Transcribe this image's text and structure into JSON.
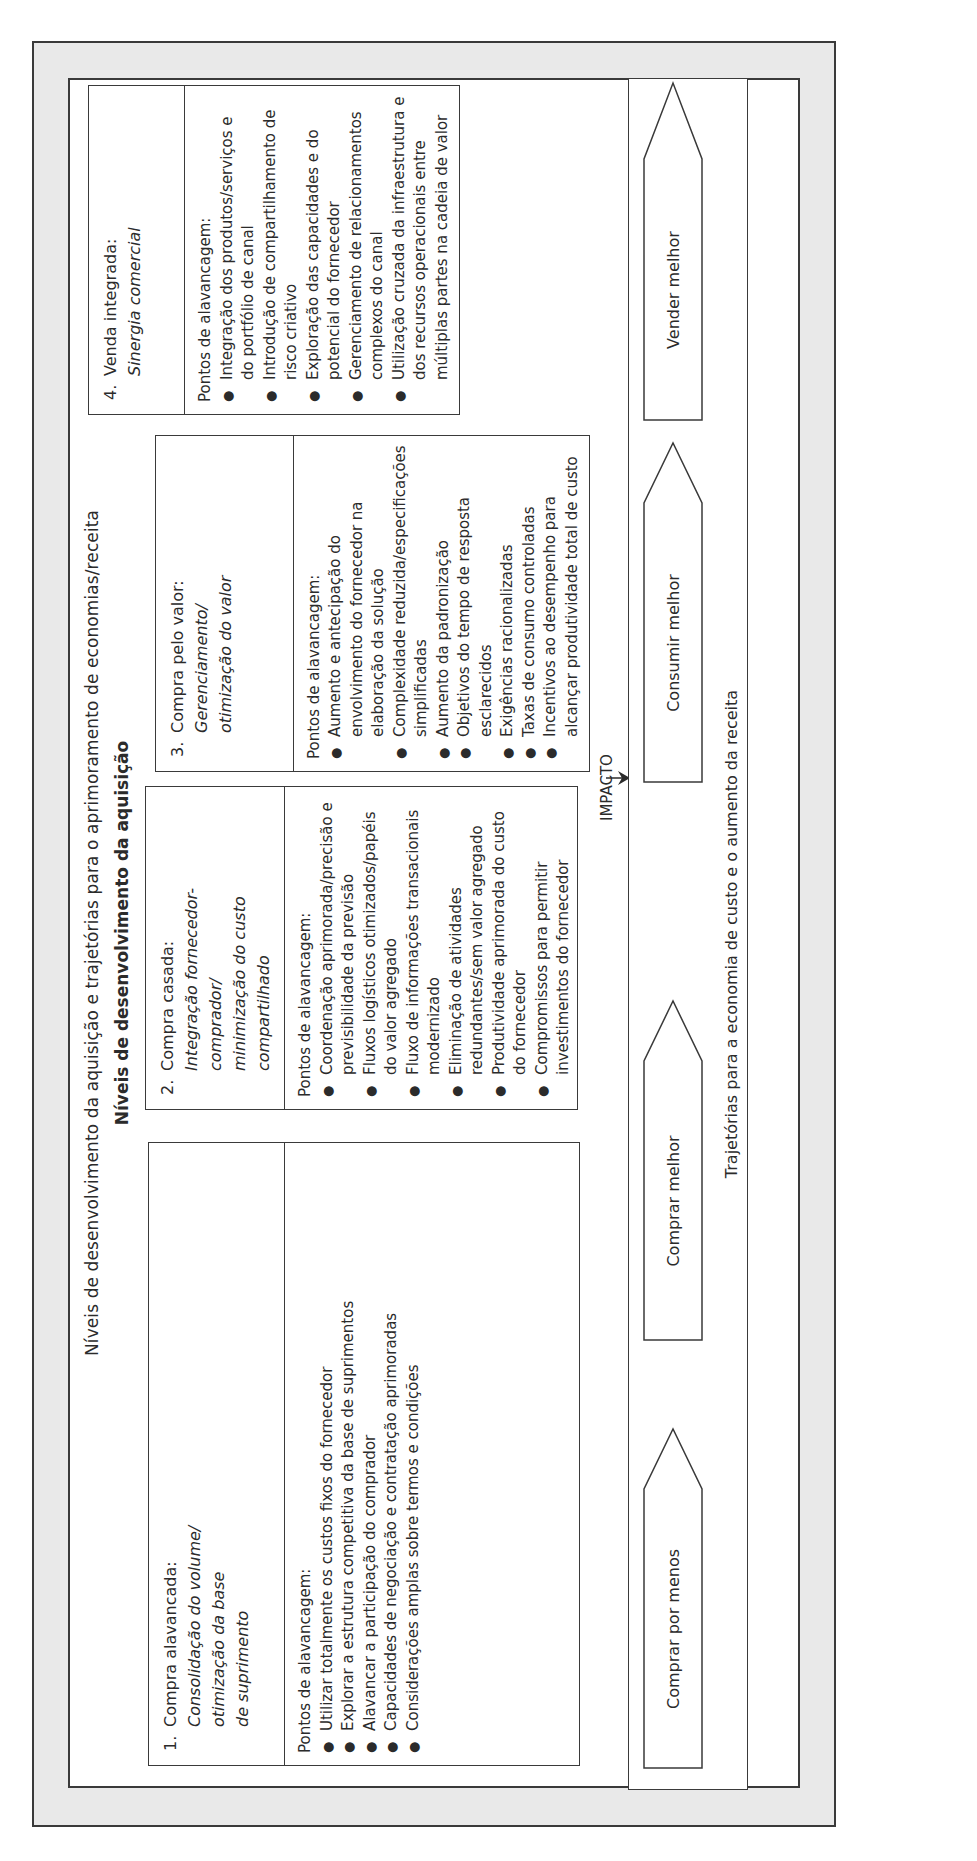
{
  "diagram": {
    "title": "Níveis de desenvolvimento da aquisição e trajetórias para o aprimoramento de economias/receita",
    "subtitle": "Níveis de desenvolvimento da aquisição",
    "levels": [
      {
        "number": "1.",
        "name": "Compra alavancada:",
        "focus_lines": [
          "Consolidação do volume/",
          "otimização da base",
          "de suprimento"
        ],
        "leverage_label": "Pontos de alavancagem:",
        "points": [
          "Utilizar totalmente os custos fixos do fornecedor",
          "Explorar a estrutura competitiva da base de suprimentos",
          "Alavancar a participação do comprador",
          "Capacidades de negociação e contratação aprimoradas",
          "Considerações amplas sobre termos e condições"
        ]
      },
      {
        "number": "2.",
        "name": "Compra casada:",
        "focus_lines": [
          "Integração fornecedor-comprador/",
          "minimização do custo",
          "compartilhado"
        ],
        "leverage_label": "Pontos de alavancagem:",
        "points": [
          "Coordenação aprimorada/precisão e previsibilidade da previsão",
          "Fluxos logísticos otimizados/papéis do valor agregado",
          "Fluxo de informações transacionais modernizado",
          "Eliminação de atividades redundantes/sem valor agregado",
          "Produtividade aprimorada do custo do fornecedor",
          "Compromissos para permitir investimentos do fornecedor"
        ]
      },
      {
        "number": "3.",
        "name": "Compra pelo valor:",
        "focus_lines": [
          "Gerenciamento/",
          "otimização do valor"
        ],
        "leverage_label": "Pontos de alavancagem:",
        "points": [
          "Aumento e antecipação do envolvimento do fornecedor na elaboração da solução",
          "Complexidade reduzida/especificações simplificadas",
          "Aumento da padronização",
          "Objetivos do tempo de resposta esclarecidos",
          "Exigências racionalizadas",
          "Taxas de consumo controladas",
          "Incentivos ao desempenho para alcançar produtividade total de custo"
        ]
      },
      {
        "number": "4.",
        "name": "Venda integrada:",
        "focus_lines": [
          "Sinergia comercial"
        ],
        "leverage_label": "Pontos de alavancagem:",
        "points": [
          "Integração dos produtos/serviços e do portfólio de canal",
          "Introdução de compartilhamento de risco criativo",
          "Exploração das capacidades e do potencial do fornecedor",
          "Gerenciamento de relacionamentos complexos do canal",
          "Utilização cruzada da infraestrutura e dos recursos operacionais entre múltiplas partes na cadeia de valor"
        ]
      }
    ],
    "impact_label": "IMPACTO",
    "trajectories": {
      "label": "Trajetórias para a economia de custo e o aumento da receita",
      "arrows": [
        "Comprar por menos",
        "Comprar melhor",
        "Consumir melhor",
        "Vender melhor"
      ]
    },
    "colors": {
      "frame_fill": "#e9e9e9",
      "line": "#3a3a3a",
      "text": "#2b2b2b",
      "background": "#ffffff"
    }
  }
}
